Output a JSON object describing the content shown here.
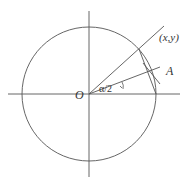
{
  "diagram": {
    "type": "unit circle half-angle construction",
    "labels": {
      "origin": "O",
      "point": "(x,y)",
      "point_a": "A",
      "half_angle": "α/2"
    },
    "colors": {
      "stroke": "#555555",
      "text": "#333333",
      "background": "#ffffff"
    }
  }
}
